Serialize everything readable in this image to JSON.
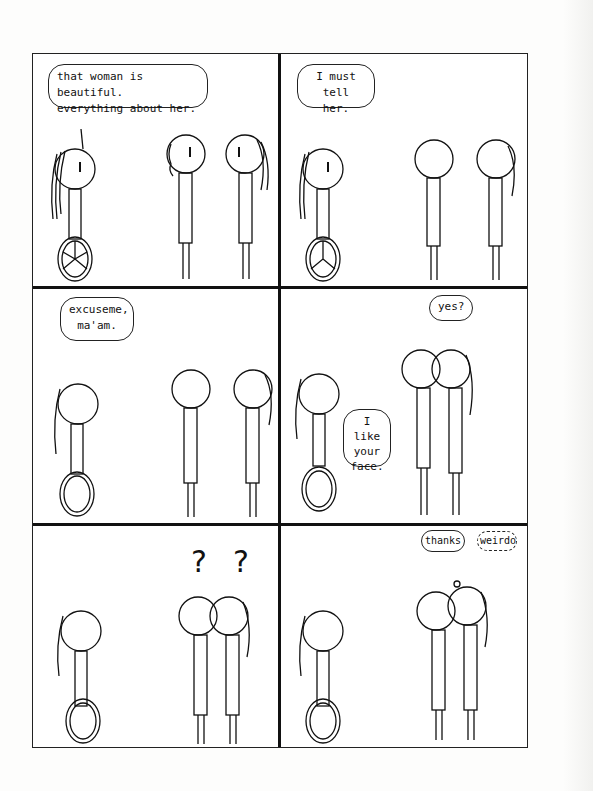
{
  "comic": {
    "panels": [
      {
        "id": 1,
        "bubbles": [
          {
            "speaker": "wheelchair-woman",
            "text": "that woman is beautiful.\neverything about her."
          }
        ]
      },
      {
        "id": 2,
        "bubbles": [
          {
            "speaker": "wheelchair-woman",
            "text": "I must tell\nher."
          }
        ]
      },
      {
        "id": 3,
        "bubbles": [
          {
            "speaker": "wheelchair-woman",
            "text": "excuseme,\nma'am."
          }
        ]
      },
      {
        "id": 4,
        "bubbles": [
          {
            "speaker": "long-hair-woman",
            "text": "yes?"
          },
          {
            "speaker": "wheelchair-woman",
            "text": "I like\nyour\nface."
          }
        ]
      },
      {
        "id": 5,
        "bubbles": [],
        "symbols": [
          "?",
          "?"
        ]
      },
      {
        "id": 6,
        "bubbles": [
          {
            "speaker": "long-hair-woman",
            "text": "thanks"
          },
          {
            "speaker": "long-hair-woman-thought",
            "text": "weirdo"
          }
        ]
      }
    ]
  },
  "colors": {
    "ink": "#111111",
    "paper": "#ffffff"
  }
}
